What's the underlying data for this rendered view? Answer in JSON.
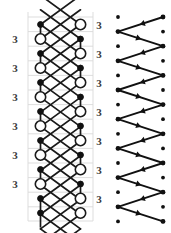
{
  "figure": {
    "title": "",
    "panels": [
      {
        "id": "left-lattice",
        "kind": "braid-lattice-diagram",
        "description": "Two-column lattice of alternating filled vertices and open circle vertices joined by crossing diagonal strands over a faint horizontal grid.",
        "geometry": {
          "grid_color": "#d9d9d9",
          "stroke_color": "#1a1a1a",
          "node_fill_open": "#ffffff",
          "node_fill_solid": "#111111",
          "column_x": [
            40.5,
            80.5
          ],
          "row_step": 14.6,
          "frame": {
            "x": 28,
            "y": 12,
            "width": 65,
            "height": 209
          }
        },
        "grid_lines_y": [
          17,
          31.6,
          46.2,
          60.8,
          75.4,
          90,
          104.6,
          119.2,
          133.8,
          148.4,
          163,
          177.6,
          192.2,
          206.8,
          221
        ],
        "nodes": [
          {
            "col": 0,
            "x": 40.5,
            "y": 24.5,
            "type": "solid"
          },
          {
            "col": 0,
            "x": 40.5,
            "y": 39.0,
            "type": "open"
          },
          {
            "col": 0,
            "x": 40.5,
            "y": 53.5,
            "type": "solid"
          },
          {
            "col": 0,
            "x": 40.5,
            "y": 68.0,
            "type": "open"
          },
          {
            "col": 0,
            "x": 40.5,
            "y": 82.5,
            "type": "solid"
          },
          {
            "col": 0,
            "x": 40.5,
            "y": 97.0,
            "type": "open"
          },
          {
            "col": 0,
            "x": 40.5,
            "y": 111.5,
            "type": "solid"
          },
          {
            "col": 0,
            "x": 40.5,
            "y": 126.0,
            "type": "open"
          },
          {
            "col": 0,
            "x": 40.5,
            "y": 140.5,
            "type": "solid"
          },
          {
            "col": 0,
            "x": 40.5,
            "y": 155.0,
            "type": "open"
          },
          {
            "col": 0,
            "x": 40.5,
            "y": 169.5,
            "type": "solid"
          },
          {
            "col": 0,
            "x": 40.5,
            "y": 184.0,
            "type": "open"
          },
          {
            "col": 0,
            "x": 40.5,
            "y": 198.5,
            "type": "solid"
          },
          {
            "col": 0,
            "x": 40.5,
            "y": 213.0,
            "type": "solid"
          },
          {
            "col": 1,
            "x": 80.5,
            "y": 24.5,
            "type": "open"
          },
          {
            "col": 1,
            "x": 80.5,
            "y": 39.0,
            "type": "solid"
          },
          {
            "col": 1,
            "x": 80.5,
            "y": 53.5,
            "type": "open"
          },
          {
            "col": 1,
            "x": 80.5,
            "y": 68.0,
            "type": "solid"
          },
          {
            "col": 1,
            "x": 80.5,
            "y": 82.5,
            "type": "open"
          },
          {
            "col": 1,
            "x": 80.5,
            "y": 97.0,
            "type": "solid"
          },
          {
            "col": 1,
            "x": 80.5,
            "y": 111.5,
            "type": "open"
          },
          {
            "col": 1,
            "x": 80.5,
            "y": 126.0,
            "type": "solid"
          },
          {
            "col": 1,
            "x": 80.5,
            "y": 140.5,
            "type": "open"
          },
          {
            "col": 1,
            "x": 80.5,
            "y": 155.0,
            "type": "solid"
          },
          {
            "col": 1,
            "x": 80.5,
            "y": 169.5,
            "type": "open"
          },
          {
            "col": 1,
            "x": 80.5,
            "y": 184.0,
            "type": "solid"
          },
          {
            "col": 1,
            "x": 80.5,
            "y": 198.5,
            "type": "open"
          },
          {
            "col": 1,
            "x": 80.5,
            "y": 213.0,
            "type": "open"
          }
        ],
        "labels_left": [
          {
            "text": "3",
            "x": 15,
            "y": 39.0
          },
          {
            "text": "3",
            "x": 15,
            "y": 68.0
          },
          {
            "text": "3",
            "x": 15,
            "y": 97.0
          },
          {
            "text": "3",
            "x": 15,
            "y": 126.0
          },
          {
            "text": "3",
            "x": 15,
            "y": 155.0
          },
          {
            "text": "3",
            "x": 15,
            "y": 184.0
          }
        ],
        "labels_right": [
          {
            "text": "3",
            "x": 99,
            "y": 24.5
          },
          {
            "text": "3",
            "x": 99,
            "y": 53.5
          },
          {
            "text": "3",
            "x": 99,
            "y": 82.5
          },
          {
            "text": "3",
            "x": 99,
            "y": 111.5
          },
          {
            "text": "3",
            "x": 99,
            "y": 140.5
          },
          {
            "text": "3",
            "x": 99,
            "y": 169.5
          },
          {
            "text": "3",
            "x": 99,
            "y": 198.5
          }
        ]
      },
      {
        "id": "right-zigzag",
        "kind": "directed-zigzag-path",
        "description": "Zigzag directed path with arrowheads sweeping between a left and a right column of a three-column dot lattice.",
        "geometry": {
          "stroke_color": "#111111",
          "dot_color": "#111111",
          "dot_radius": 1.9,
          "column_x": [
            118,
            140.5,
            163
          ],
          "row_step": 14.6
        },
        "dots": [
          {
            "x": 118,
            "y": 17
          },
          {
            "x": 163,
            "y": 17
          },
          {
            "x": 118,
            "y": 31.6
          },
          {
            "x": 163,
            "y": 31.6
          },
          {
            "x": 118,
            "y": 46.2
          },
          {
            "x": 163,
            "y": 46.2
          },
          {
            "x": 118,
            "y": 60.8
          },
          {
            "x": 163,
            "y": 60.8
          },
          {
            "x": 118,
            "y": 75.4
          },
          {
            "x": 163,
            "y": 75.4
          },
          {
            "x": 118,
            "y": 90.0
          },
          {
            "x": 163,
            "y": 90.0
          },
          {
            "x": 118,
            "y": 104.6
          },
          {
            "x": 163,
            "y": 104.6
          },
          {
            "x": 118,
            "y": 119.2
          },
          {
            "x": 163,
            "y": 119.2
          },
          {
            "x": 118,
            "y": 133.8
          },
          {
            "x": 163,
            "y": 133.8
          },
          {
            "x": 118,
            "y": 148.4
          },
          {
            "x": 163,
            "y": 148.4
          },
          {
            "x": 118,
            "y": 163.0
          },
          {
            "x": 163,
            "y": 163.0
          },
          {
            "x": 118,
            "y": 177.6
          },
          {
            "x": 163,
            "y": 177.6
          },
          {
            "x": 118,
            "y": 192.2
          },
          {
            "x": 163,
            "y": 192.2
          },
          {
            "x": 118,
            "y": 206.8
          },
          {
            "x": 163,
            "y": 206.8
          },
          {
            "x": 118,
            "y": 221.4
          },
          {
            "x": 163,
            "y": 221.4
          }
        ],
        "path_vertices": [
          {
            "x": 163,
            "y": 17.0
          },
          {
            "x": 118,
            "y": 31.6
          },
          {
            "x": 163,
            "y": 46.2
          },
          {
            "x": 118,
            "y": 60.8
          },
          {
            "x": 163,
            "y": 75.4
          },
          {
            "x": 118,
            "y": 90.0
          },
          {
            "x": 163,
            "y": 104.6
          },
          {
            "x": 118,
            "y": 119.2
          },
          {
            "x": 163,
            "y": 133.8
          },
          {
            "x": 118,
            "y": 148.4
          },
          {
            "x": 163,
            "y": 163.0
          },
          {
            "x": 118,
            "y": 177.6
          },
          {
            "x": 163,
            "y": 192.2
          },
          {
            "x": 118,
            "y": 206.8
          },
          {
            "x": 163,
            "y": 221.4
          }
        ],
        "arrow_direction": "forward-along-path",
        "segment_count": 14
      }
    ]
  }
}
